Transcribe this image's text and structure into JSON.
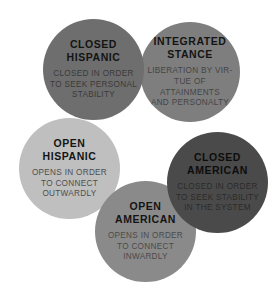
{
  "diagram": {
    "type": "venn-style-circle-cluster",
    "background_color": "#ffffff",
    "nodes": [
      {
        "id": "closed-hispanic",
        "title": "CLOSED\nHISPANIC",
        "body": "CLOSED IN ORDER\nTO SEEK PERSONAL\nSTABILITY",
        "color": "#6e6e6e"
      },
      {
        "id": "integrated-stance",
        "title": "INTEGRATED\nSTANCE",
        "body": "LIBERATION BY VIR-\nTUE OF ATTAINMENTS\nAND PERSONALTY",
        "color": "#7e7e7e"
      },
      {
        "id": "open-hispanic",
        "title": "OPEN\nHISPANIC",
        "body": "OPENS IN ORDER\nTO CONNECT\nOUTWARDLY",
        "color": "#bfbfbf"
      },
      {
        "id": "closed-american",
        "title": "CLOSED\nAMERICAN",
        "body": "CLOSED IN ORDER\nTO SEEK STABILITY\nIN THE SYSTEM",
        "color": "#4a4a4a"
      },
      {
        "id": "open-american",
        "title": "OPEN\nAMERICAN",
        "body": "OPENS IN ORDER\nTO CONNECT\nINWARDLY",
        "color": "#8a8a8a"
      }
    ]
  }
}
